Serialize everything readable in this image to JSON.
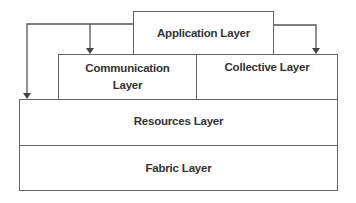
{
  "diagram": {
    "type": "layered-architecture",
    "layers": {
      "application": "Application Layer",
      "communication_line1": "Communication",
      "communication_line2": "Layer",
      "collective": "Collective Layer",
      "resources": "Resources Layer",
      "fabric": "Fabric Layer"
    },
    "arrows": [
      {
        "from": "Application Layer",
        "to": "Resources Layer"
      },
      {
        "from": "Application Layer",
        "to": "Communication Layer"
      },
      {
        "from": "Application Layer",
        "to": "Collective Layer"
      }
    ],
    "colors": {
      "stroke": "#666666",
      "text": "#333333",
      "background": "#ffffff"
    }
  }
}
